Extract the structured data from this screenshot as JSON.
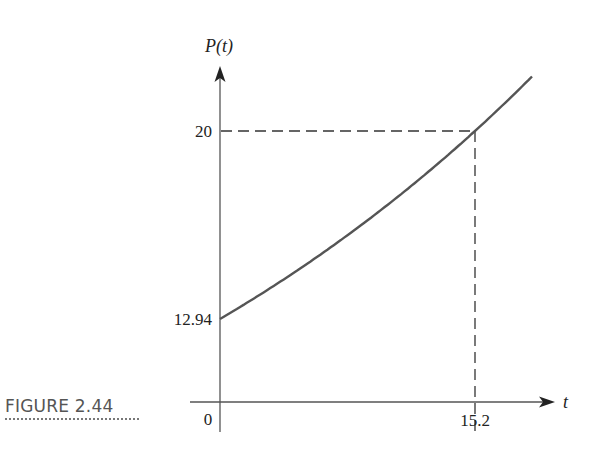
{
  "figure": {
    "caption": "FIGURE 2.44"
  },
  "chart_data": {
    "type": "line",
    "title": "",
    "xlabel": "t",
    "ylabel": "P(t)",
    "x_ticks": [
      "0",
      "15.2"
    ],
    "y_ticks": [
      "12.94",
      "20"
    ],
    "series": [
      {
        "name": "P(t)",
        "function": "P(t) = 12.94 * e^(0.02865 t)",
        "x": [
          0,
          2,
          4,
          6,
          8,
          10,
          12,
          14,
          15.2,
          16,
          18
        ],
        "values": [
          12.94,
          13.7,
          14.5,
          15.35,
          16.25,
          17.2,
          18.21,
          19.27,
          20.0,
          20.45,
          21.66
        ]
      }
    ],
    "annotations": [
      {
        "type": "dashed-horizontal",
        "y": 20,
        "from_x": 0,
        "to_x": 15.2
      },
      {
        "type": "dashed-vertical",
        "x": 15.2,
        "from_y": 20,
        "to_y": "x-axis"
      }
    ],
    "xlim": [
      0,
      19.5
    ],
    "grid": false,
    "legend": "none"
  },
  "labels": {
    "y_axis": "P(t)",
    "x_axis": "t",
    "origin": "0",
    "y_tick_high": "20",
    "y_tick_low": "12.94",
    "x_tick": "15.2"
  }
}
